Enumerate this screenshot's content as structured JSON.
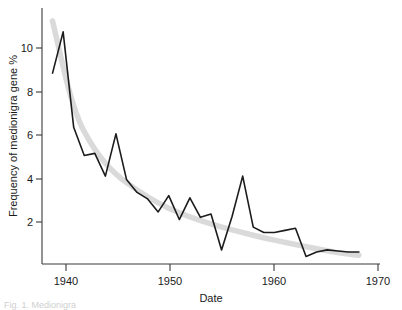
{
  "figure": {
    "caption": "Fig. 1. Medionigra"
  },
  "chart_data": {
    "type": "line",
    "title": "",
    "subtitle": "",
    "xlabel": "Date",
    "ylabel": "Frequency of medionigra gene  %",
    "xlim": [
      1938,
      1970
    ],
    "ylim": [
      0.4,
      12.2
    ],
    "xticks": [
      1940,
      1950,
      1960,
      1970
    ],
    "xtick_labels": [
      "1940",
      "1950",
      "1960",
      "1970"
    ],
    "yticks": [
      2,
      4,
      6,
      8,
      10
    ],
    "ytick_labels": [
      "2",
      "4",
      "6",
      "8",
      "10"
    ],
    "grid": false,
    "legend": false,
    "legend_position": "none",
    "colors": {
      "data_line": "#1c1c1c",
      "trend_band": "#dadada",
      "axis": "#3a3a3a",
      "background": "#ffffff"
    },
    "series": [
      {
        "name": "Observed medionigra gene frequency",
        "style": "line",
        "color": "#1c1c1c",
        "x": [
          1939,
          1940,
          1941,
          1942,
          1943,
          1944,
          1945,
          1946,
          1947,
          1948,
          1949,
          1950,
          1951,
          1952,
          1953,
          1954,
          1955,
          1956,
          1957,
          1958,
          1959,
          1960,
          1961,
          1962,
          1963,
          1964,
          1965,
          1966,
          1967,
          1968
        ],
        "values": [
          9.2,
          11.1,
          6.7,
          5.4,
          5.5,
          4.45,
          6.4,
          4.3,
          3.7,
          3.4,
          2.8,
          3.55,
          2.45,
          3.45,
          2.55,
          2.7,
          1.05,
          2.6,
          4.45,
          2.1,
          1.85,
          1.85,
          1.95,
          2.05,
          0.75,
          0.95,
          1.05,
          1.0,
          0.95,
          0.95
        ]
      },
      {
        "name": "Fitted decline trend",
        "style": "band",
        "color": "#dadada",
        "x": [
          1939,
          1941,
          1943,
          1945,
          1947,
          1949,
          1951,
          1953,
          1955,
          1957,
          1959,
          1961,
          1963,
          1965,
          1967,
          1968
        ],
        "values": [
          11.6,
          7.4,
          5.6,
          4.5,
          3.8,
          3.2,
          2.75,
          2.4,
          2.1,
          1.85,
          1.6,
          1.4,
          1.2,
          1.0,
          0.85,
          0.8
        ]
      }
    ],
    "annotations": []
  }
}
